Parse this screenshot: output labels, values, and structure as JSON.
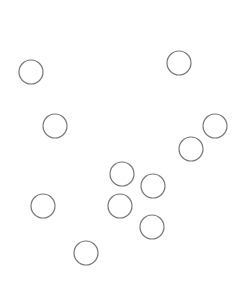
{
  "canvas": {
    "width": 246,
    "height": 292,
    "background": "#ffffff"
  },
  "style": {
    "stroke": "#777777",
    "stroke_width": 1.2,
    "fill": "none",
    "radius": 12
  },
  "circles": [
    {
      "cx": 31,
      "cy": 72
    },
    {
      "cx": 55,
      "cy": 126
    },
    {
      "cx": 179,
      "cy": 63
    },
    {
      "cx": 215,
      "cy": 126
    },
    {
      "cx": 191,
      "cy": 149
    },
    {
      "cx": 122,
      "cy": 174
    },
    {
      "cx": 153,
      "cy": 186
    },
    {
      "cx": 120,
      "cy": 206
    },
    {
      "cx": 152,
      "cy": 227
    },
    {
      "cx": 43,
      "cy": 206
    },
    {
      "cx": 86,
      "cy": 253
    }
  ]
}
